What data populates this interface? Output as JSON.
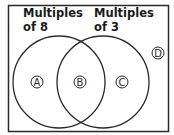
{
  "diagram": {
    "type": "venn",
    "sets": [
      {
        "id": "left",
        "label_line1": "Multiples",
        "label_line2": "of 8"
      },
      {
        "id": "right",
        "label_line1": "Multiples",
        "label_line2": "of 3"
      }
    ],
    "regions": [
      {
        "label": "A",
        "location": "only multiples of 8"
      },
      {
        "label": "B",
        "location": "intersection"
      },
      {
        "label": "C",
        "location": "only multiples of 3"
      },
      {
        "label": "D",
        "location": "outside both sets"
      }
    ],
    "colors": {
      "stroke": "#2a2a2a",
      "background": "#ffffff"
    }
  }
}
